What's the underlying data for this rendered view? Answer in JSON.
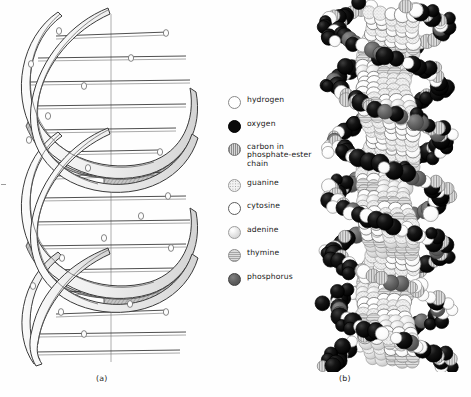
{
  "figure": {
    "panels": [
      {
        "id": "a",
        "caption": "(a)",
        "kind": "ribbon-double-helix-diagram"
      },
      {
        "id": "b",
        "caption": "(b)",
        "kind": "space-filling-model"
      }
    ]
  },
  "legend": {
    "items": [
      {
        "label": "hydrogen",
        "swatch": "hydrogen",
        "style": "white-open-circle",
        "color": "#ffffff"
      },
      {
        "label": "oxygen",
        "swatch": "oxygen",
        "style": "solid-black-circle",
        "color": "#0a0a0a"
      },
      {
        "label": "carbon in\nphosphate-ester\nchain",
        "swatch": "carbon",
        "style": "vertical-hatched-circle",
        "color": "#b0b0b0"
      },
      {
        "label": "guanine",
        "swatch": "guanine",
        "style": "stippled-circle",
        "color": "#f0f0f0"
      },
      {
        "label": "cytosine",
        "swatch": "cytosine",
        "style": "white-outlined-circle",
        "color": "#ffffff"
      },
      {
        "label": "adenine",
        "swatch": "adenine",
        "style": "light-gray-shaded-circle",
        "color": "#e0e0e0"
      },
      {
        "label": "thymine",
        "swatch": "thymine",
        "style": "horizontal-lined-circle",
        "color": "#c8c8c8"
      },
      {
        "label": "phosphorus",
        "swatch": "phosphorus",
        "style": "dark-gray-circle",
        "color": "#5a5a5a"
      }
    ]
  },
  "chart_data": {
    "type": "diagram",
    "title": "",
    "subtitle": "",
    "panel_a": {
      "description": "Line-drawing of a DNA double helix drawn as two shaded ribbons wound around a vertical central axis, crossed by horizontal base-pair rungs, with small open circles marking phosphate positions along the ribbon edges.",
      "turns": 3,
      "rungs": 17,
      "axis": "vertical-center-line",
      "ribbon_fill": "#ededed",
      "ribbon_shadow": "#8f8f8f",
      "line_color": "#3a3a3a"
    },
    "panel_b": {
      "description": "Space-filling (van der Waals) model of the same DNA double helix built from overlapping atom spheres, coloured per the legend: black oxygen, white hydrogen and cytosine, hatched carbon, stippled guanine, shaded adenine and thymine, dark gray phosphorus.",
      "turns": 3,
      "atom_count_approx": 300,
      "atom_radius_px": [
        5,
        9
      ]
    }
  }
}
